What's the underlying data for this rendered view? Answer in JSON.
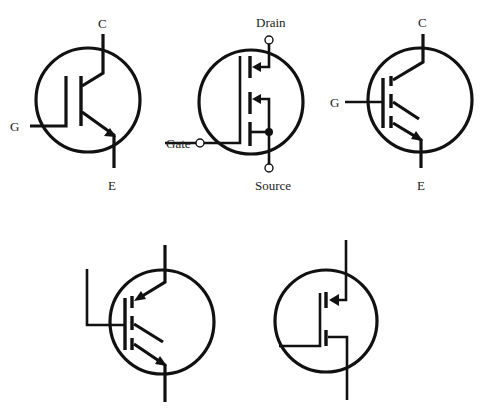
{
  "figure": {
    "type": "semiconductor symbols",
    "colors": {
      "line": "#111111",
      "background": "#ffffff",
      "label": "#222222"
    },
    "symbols": [
      {
        "id": "igbt-bjt-style",
        "labels": {
          "collector": "C",
          "gate": "G",
          "emitter": "E"
        }
      },
      {
        "id": "igbt-mosfet-style",
        "labels": {
          "drain": "Drain",
          "gate": "Gate",
          "source": "Source"
        }
      },
      {
        "id": "igbt-common-symbol",
        "labels": {
          "collector": "C",
          "gate": "G",
          "emitter": "E"
        }
      },
      {
        "id": "igbt-alternate-unlabeled",
        "labels": {}
      },
      {
        "id": "mosfet-unlabeled",
        "labels": {}
      }
    ]
  }
}
